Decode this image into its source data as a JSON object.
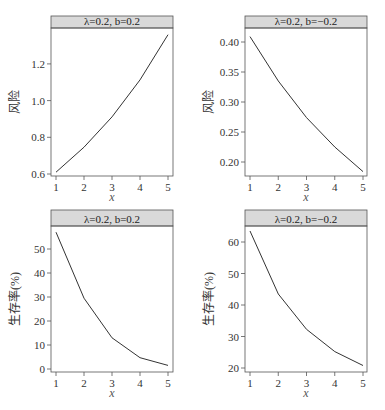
{
  "chart_data": [
    {
      "type": "line",
      "title": "λ=0.2, b=0.2",
      "xlabel": "x",
      "ylabel": "风险",
      "x": [
        1,
        2,
        3,
        4,
        5
      ],
      "series": [
        {
          "name": "风险",
          "values": [
            0.61,
            0.746,
            0.911,
            1.113,
            1.359
          ]
        }
      ],
      "yticks": [
        "0.6",
        "0.8",
        "1.0",
        "1.2"
      ],
      "xticks": [
        "1",
        "2",
        "3",
        "4",
        "5"
      ],
      "ylim": [
        0.59,
        1.38
      ]
    },
    {
      "type": "line",
      "title": "λ=0.2, b=−0.2",
      "xlabel": "x",
      "ylabel": "风险",
      "x": [
        1,
        2,
        3,
        4,
        5
      ],
      "series": [
        {
          "name": "风险",
          "values": [
            0.409,
            0.335,
            0.274,
            0.225,
            0.184
          ]
        }
      ],
      "yticks": [
        "0.20",
        "0.25",
        "0.30",
        "0.35",
        "0.40"
      ],
      "xticks": [
        "1",
        "2",
        "3",
        "4",
        "5"
      ],
      "ylim": [
        0.18,
        0.42
      ]
    },
    {
      "type": "line",
      "title": "λ=0.2, b=0.2",
      "xlabel": "x",
      "ylabel": "生存率(%)",
      "x": [
        1,
        2,
        3,
        4,
        5
      ],
      "series": [
        {
          "name": "生存率(%)",
          "values": [
            57,
            29.5,
            13,
            4.7,
            1.5
          ]
        }
      ],
      "yticks": [
        "0",
        "10",
        "20",
        "30",
        "40",
        "50"
      ],
      "xticks": [
        "1",
        "2",
        "3",
        "4",
        "5"
      ],
      "ylim": [
        0,
        60
      ]
    },
    {
      "type": "line",
      "title": "λ=0.2, b=−0.2",
      "xlabel": "x",
      "ylabel": "生存率(%)",
      "x": [
        1,
        2,
        3,
        4,
        5
      ],
      "series": [
        {
          "name": "生存率(%)",
          "values": [
            63.5,
            43.5,
            32.3,
            25.2,
            20.8
          ]
        }
      ],
      "yticks": [
        "20",
        "30",
        "40",
        "50",
        "60"
      ],
      "xticks": [
        "1",
        "2",
        "3",
        "4",
        "5"
      ],
      "ylim": [
        19,
        66
      ]
    }
  ],
  "panels": [
    {
      "strip": "λ=0.2, b=0.2",
      "ylabel": "风险",
      "xlabel": "x"
    },
    {
      "strip": "λ=0.2, b=−0.2",
      "ylabel": "风险",
      "xlabel": "x"
    },
    {
      "strip": "λ=0.2, b=0.2",
      "ylabel": "生存率(%)",
      "xlabel": "x"
    },
    {
      "strip": "λ=0.2, b=−0.2",
      "ylabel": "生存率(%)",
      "xlabel": "x"
    }
  ]
}
